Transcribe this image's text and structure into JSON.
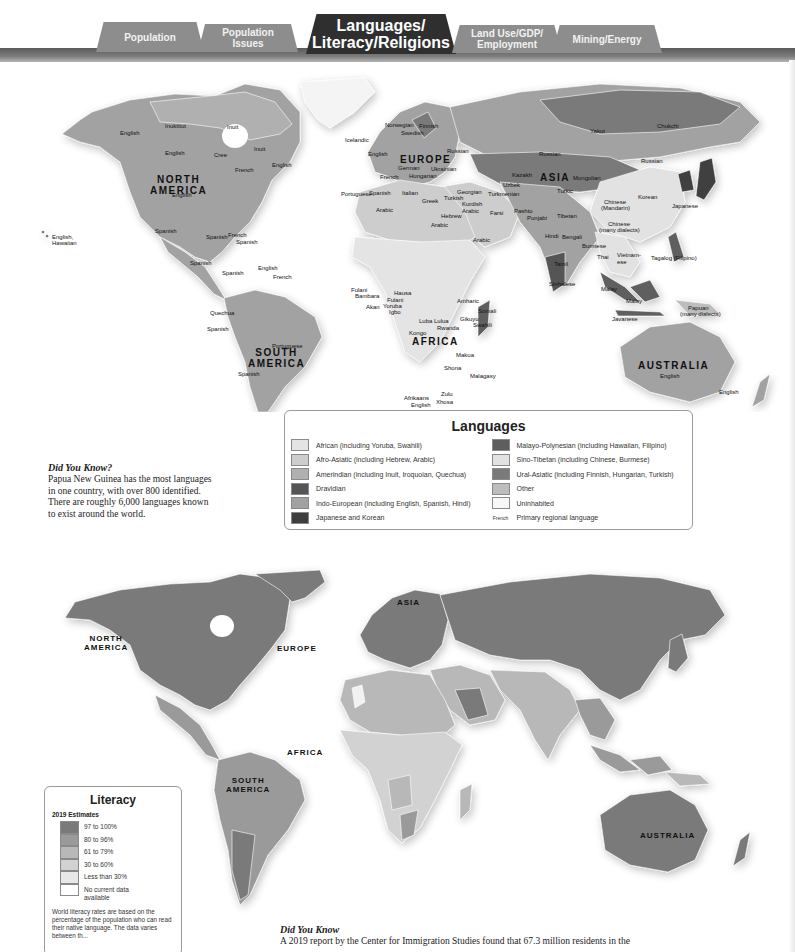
{
  "tabs": [
    {
      "lines": [
        "Population"
      ],
      "active": false
    },
    {
      "lines": [
        "Population",
        "Issues"
      ],
      "active": false
    },
    {
      "lines": [
        "Languages/",
        "Literacy/Religions"
      ],
      "active": true
    },
    {
      "lines": [
        "Land Use/GDP/",
        "Employment"
      ],
      "active": false
    },
    {
      "lines": [
        "Mining/Energy"
      ],
      "active": false
    }
  ],
  "languages_map": {
    "continents": {
      "north_america": [
        "NORTH",
        "AMERICA"
      ],
      "south_america": [
        "SOUTH",
        "AMERICA"
      ],
      "europe": "EUROPE",
      "asia": "ASIA",
      "africa": "AFRICA",
      "australia": "AUSTRALIA"
    },
    "labels": {
      "english_alaska": "English",
      "inuktitut": "Inuktitut",
      "inuit_1": "Inuit",
      "inuit_2": "Inuit",
      "english_canada": "English",
      "cree": "Cree",
      "french_quebec": "French",
      "english_newfoundland": "English",
      "english_us": "English",
      "spanish_mexico": "Spanish",
      "spanish_cuba": "Spanish",
      "french_haiti": "French",
      "spanish_dr": "Spanish",
      "spanish_central": "Spanish",
      "spanish_venezuela": "Spanish",
      "english_guyana": "English",
      "french_guiana": "French",
      "quechua": "Quechua",
      "spanish_peru": "Spanish",
      "portuguese_brazil": "Portuguese",
      "spanish_argentina": "Spanish",
      "english_hawaiian_1": "English,",
      "english_hawaiian_2": "Hawaiian",
      "icelandic": "Icelandic",
      "norwegian": "Norwegian",
      "finnish": "Finnish",
      "swedish": "Swedish",
      "english_uk": "English",
      "russian_west": "Russian",
      "german": "German",
      "ukrainian": "Ukrainian",
      "french_france": "French",
      "hungarian": "Hungarian",
      "portuguese": "Portuguese",
      "spanish_spain": "Spanish",
      "italian": "Italian",
      "greek": "Greek",
      "georgian": "Georgian",
      "turkish": "Turkish",
      "kurdish": "Kurdish",
      "arabic_iraq": "Arabic",
      "hebrew": "Hebrew",
      "arabic_egypt": "Arabic",
      "arabic_nw": "Arabic",
      "arabic_arabia": "Arabic",
      "yakut": "Yakut",
      "chukchi": "Chukchi",
      "russian_mid": "Russian",
      "russian_east": "Russian",
      "kazakh": "Kazakh",
      "mongolian": "Mongolian",
      "uzbek": "Uzbek",
      "turkmenian": "Turkmenian",
      "turkic": "Turkic",
      "farsi": "Farsi",
      "pashto": "Pashto",
      "punjabi": "Punjabi",
      "tibetan": "Tibetan",
      "chinese_mandarin_1": "Chinese",
      "chinese_mandarin_2": "(Mandarin)",
      "korean": "Korean",
      "japanese": "Japanese",
      "chinese_dialects_1": "Chinese",
      "chinese_dialects_2": "(many dialects)",
      "hindi": "Hindi",
      "bengali": "Bengali",
      "burmese": "Burmese",
      "thai": "Thai",
      "vietnamese": "Vietnam-ese",
      "tagalog": "Tagalog (Filipino)",
      "tamil": "Tamil",
      "sinhalese": "Sinhalese",
      "malay_1": "Malay",
      "malay_2": "Malay",
      "javanese": "Javanese",
      "papuan_1": "Papuan",
      "papuan_2": "(many dialects)",
      "english_australia": "English",
      "english_nz": "English",
      "fulani_1": "Fulani",
      "bambara": "Bambara",
      "hausa": "Hausa",
      "fulani_2": "Fulani",
      "akan": "Akan",
      "yoruba": "Yoruba",
      "igbo": "Igbo",
      "amharic": "Amharic",
      "somali": "Somali",
      "luba_lulua": "Luba Lulua",
      "gikuyu": "Gikuyu",
      "rwanda": "Rwanda",
      "swahili": "Swahili",
      "kongo": "Kongo",
      "makua": "Makua",
      "shona": "Shona",
      "malagasy": "Malagasy",
      "zulu": "Zulu",
      "xhosa": "Xhosa",
      "afrikaans": "Afrikaans",
      "english_sa": "English"
    }
  },
  "languages_legend": {
    "title": "Languages",
    "left": [
      {
        "label": "African (including Yoruba, Swahili)",
        "color": "#e4e4e4"
      },
      {
        "label": "Afro-Asiatic (including Hebrew, Arabic)",
        "color": "#cdcdcd"
      },
      {
        "label": "Amerindian (including Inuit, Iroquoian, Quechua)",
        "color": "#b0b0b0"
      },
      {
        "label": "Dravidian",
        "color": "#555555"
      },
      {
        "label": "Indo-European (including English, Spanish, Hindi)",
        "color": "#a2a2a2"
      },
      {
        "label": "Japanese and Korean",
        "color": "#3f3f3f"
      }
    ],
    "right": [
      {
        "label": "Malayo-Polynesian (including Hawaiian, Filipino)",
        "color": "#5e5e5e"
      },
      {
        "label": "Sino-Tibetan (including Chinese, Burmese)",
        "color": "#e2e2e2"
      },
      {
        "label": "Ural-Asiatic (including Finnish, Hungarian, Turkish)",
        "color": "#7a7a7a"
      },
      {
        "label": "Other",
        "color": "#bdbdbd"
      },
      {
        "label": "Uninhabited",
        "color": "#f7f7f7"
      }
    ],
    "primary_sample": "French",
    "primary_label": "Primary regional language"
  },
  "did_you_know_1": {
    "heading": "Did You Know?",
    "lines": [
      "Papua New Guinea has the most languages",
      "in one country, with over 800 identified.",
      "There are roughly 6,000 languages known",
      "to exist around the world."
    ]
  },
  "literacy_map": {
    "continents": {
      "north_america": [
        "NORTH",
        "AMERICA"
      ],
      "south_america": [
        "SOUTH",
        "AMERICA"
      ],
      "europe": "EUROPE",
      "asia": "ASIA",
      "africa": "AFRICA",
      "australia": "AUSTRALIA"
    }
  },
  "literacy_legend": {
    "title": "Literacy",
    "subtitle": "2019 Estimates",
    "items": [
      {
        "label": "97 to 100%",
        "color": "#7a7a7a"
      },
      {
        "label": "80 to 96%",
        "color": "#9a9a9a"
      },
      {
        "label": "61 to 79%",
        "color": "#b8b8b8"
      },
      {
        "label": "30 to 60%",
        "color": "#d2d2d2"
      },
      {
        "label": "Less than 30%",
        "color": "#e8e8e8"
      },
      {
        "label": "No current data available",
        "color": "#ffffff"
      }
    ],
    "note": "World literacy rates are based on the percentage of the population who can read their native language. The data varies between th..."
  },
  "did_you_know_2": {
    "heading": "Did You Know",
    "text": "A 2019 report by the Center for Immigration Studies found that 67.3 million residents in the"
  }
}
